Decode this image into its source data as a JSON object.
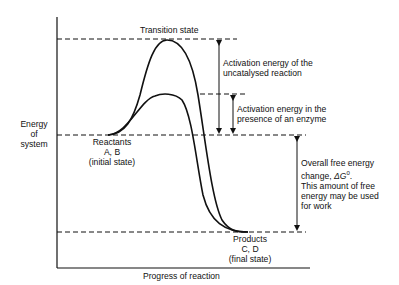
{
  "diagram": {
    "y_axis_label": [
      "Energy",
      "of",
      "system"
    ],
    "x_axis_label": "Progress of reaction",
    "transition_state_label": "Transition state",
    "activation_uncatalysed": [
      "Activation energy of the",
      "uncatalysed reaction"
    ],
    "activation_enzyme": [
      "Activation energy in the",
      "presence of an enzyme"
    ],
    "reactants": [
      "Reactants",
      "A, B",
      "(initial state)"
    ],
    "products": [
      "Products",
      "C, D",
      "(final state)"
    ],
    "free_energy": {
      "line1": "Overall free energy",
      "line2_prefix": "change, ",
      "symbol": "ΔG",
      "superscript": "0",
      "line2_suffix": ".",
      "line3": "This amount of free",
      "line4": "energy may be used",
      "line5": "for work"
    },
    "colors": {
      "line": "#111111",
      "background": "#ffffff"
    }
  }
}
